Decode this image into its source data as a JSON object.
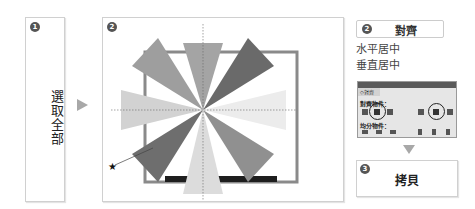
{
  "steps": [
    {
      "number": "1",
      "label": "選取全部"
    },
    {
      "number": "2",
      "label": ""
    },
    {
      "number": "2",
      "label": "對齊"
    },
    {
      "number": "3",
      "label": "拷貝"
    }
  ],
  "instructions": [
    "水平居中",
    "垂直居中"
  ],
  "align_panel": {
    "tab": "◇對齊",
    "align_objects_label": "對齊物件：",
    "distribute_objects_label": "均分物件："
  },
  "annotation": {
    "marker": "★"
  },
  "colors": {
    "arrow": "#a8a8a8",
    "badge": "#555555",
    "panel_bg": "#e6e6e6",
    "ray_dark": "#6e6e6e",
    "ray_mid": "#9a9a9a",
    "ray_light": "#d8d8d8"
  }
}
